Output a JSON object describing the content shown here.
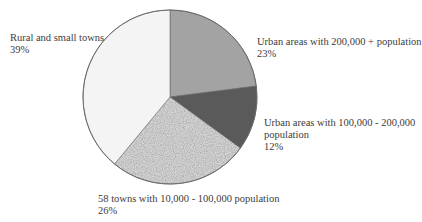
{
  "chart_data": {
    "type": "pie",
    "title": "",
    "categories": [
      "Urban areas with 200,000 + population",
      "Urban areas with 100,000 - 200,000 population",
      "58 towns with 10,000 - 100,000 population",
      "Rural and small towns"
    ],
    "values": [
      23,
      12,
      26,
      39
    ],
    "unit": "%",
    "start_angle": "12 o'clock, clockwise",
    "slice_fills": [
      "#a3a3a3",
      "#5a5a5a",
      "speckled-pattern",
      "#f4f4f4"
    ],
    "legend": "none (direct labels)"
  },
  "labels": {
    "urban_200k": {
      "line1": "Urban areas with 200,000 + population",
      "pct": "23%"
    },
    "urban_100k": {
      "line1": "Urban areas with 100,000 - 200,000",
      "line2": "population",
      "pct": "12%"
    },
    "towns_58": {
      "line1": "58 towns with 10,000 - 100,000 population",
      "pct": "26%"
    },
    "rural": {
      "line1": "Rural and small towns",
      "pct": "39%"
    }
  }
}
